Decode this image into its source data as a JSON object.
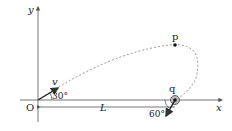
{
  "diagram": {
    "axes": {
      "x_label": "x",
      "y_label": "y",
      "origin_label": "O"
    },
    "points": {
      "p_label": "p",
      "q_label": "q"
    },
    "velocity": {
      "label": "v",
      "angle_label": "30°"
    },
    "q_velocity": {
      "angle_label": "60°"
    },
    "distance": {
      "label": "L"
    },
    "colors": {
      "line": "#333333",
      "dashed": "#888888",
      "axis": "#555555"
    }
  }
}
